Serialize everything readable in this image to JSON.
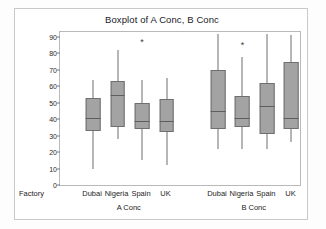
{
  "chart_data": {
    "type": "boxplot",
    "title": "Boxplot of A Conc, B Conc",
    "xlabel": "Factory",
    "ylabel": "",
    "ylim": [
      0,
      93
    ],
    "yticks": [
      0,
      10,
      20,
      30,
      40,
      50,
      60,
      70,
      80,
      90
    ],
    "ytick_labels": [
      "0",
      "10",
      "20",
      "30",
      "40",
      "50",
      "60",
      "70",
      "80",
      "90"
    ],
    "grid": false,
    "legend": false,
    "panel_label": "Factory",
    "categories": [
      "Dubai",
      "Nigeria",
      "Spain",
      "UK"
    ],
    "groups": [
      "A Conc",
      "B Conc"
    ],
    "boxes": [
      {
        "group": "A Conc",
        "category": "Dubai",
        "whisker_low": 10,
        "q1": 33,
        "median": 41,
        "q3": 53,
        "whisker_high": 64,
        "outliers": []
      },
      {
        "group": "A Conc",
        "category": "Nigeria",
        "whisker_low": 28,
        "q1": 35,
        "median": 55,
        "q3": 63,
        "whisker_high": 82,
        "outliers": []
      },
      {
        "group": "A Conc",
        "category": "Spain",
        "whisker_low": 15,
        "q1": 34,
        "median": 39,
        "q3": 50,
        "whisker_high": 64,
        "outliers": [
          87
        ]
      },
      {
        "group": "A Conc",
        "category": "UK",
        "whisker_low": 12,
        "q1": 32,
        "median": 39,
        "q3": 52,
        "whisker_high": 65,
        "outliers": []
      },
      {
        "group": "B Conc",
        "category": "Dubai",
        "whisker_low": 22,
        "q1": 34,
        "median": 45,
        "q3": 70,
        "whisker_high": 92,
        "outliers": []
      },
      {
        "group": "B Conc",
        "category": "Nigeria",
        "whisker_low": 22,
        "q1": 35,
        "median": 41,
        "q3": 54,
        "whisker_high": 78,
        "outliers": [
          85
        ]
      },
      {
        "group": "B Conc",
        "category": "Spain",
        "whisker_low": 22,
        "q1": 31,
        "median": 48,
        "q3": 62,
        "whisker_high": 92,
        "outliers": []
      },
      {
        "group": "B Conc",
        "category": "UK",
        "whisker_low": 26,
        "q1": 34,
        "median": 41,
        "q3": 75,
        "whisker_high": 91,
        "outliers": []
      }
    ],
    "colors": {
      "box_fill": "#a3a3a3",
      "box_edge": "#6f6f6f",
      "whisker": "#6e6e6e",
      "median": "#5e5e5e",
      "text": "#1d1d1d",
      "panel_border": "#b9b9b9",
      "outer_border": "#c9c9c9",
      "background": "#ffffff"
    }
  },
  "axis": {
    "factory_label": "Factory",
    "category_labels": [
      "Dubai",
      "Nigeria",
      "Spain",
      "UK",
      "Dubai",
      "Nigeria",
      "Spain",
      "UK"
    ],
    "group_labels": [
      "A Conc",
      "B Conc"
    ]
  }
}
